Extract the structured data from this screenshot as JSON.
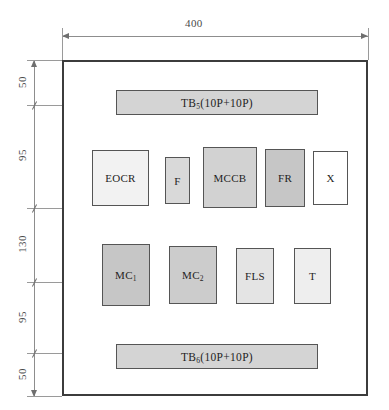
{
  "drawing": {
    "title": "Control panel internal component layout",
    "overall_width_label": "400",
    "vertical_dimensions": [
      "50",
      "95",
      "130",
      "95",
      "50"
    ],
    "enclosure": {
      "fill": "#ffffff",
      "border_color": "#3c3c3c"
    }
  },
  "terminals": [
    {
      "name": "TB5",
      "label": "TB",
      "subscript": "5",
      "suffix": "(10P+10P)",
      "fill": "#d4d4d4"
    },
    {
      "name": "TB6",
      "label": "TB",
      "subscript": "6",
      "suffix": "(10P+10P)",
      "fill": "#d4d4d4"
    }
  ],
  "components_row_upper": [
    {
      "label": "EOCR",
      "subscript": "",
      "fill": "#f2f2f2"
    },
    {
      "label": "F",
      "subscript": "",
      "fill": "#d9d9d9"
    },
    {
      "label": "MCCB",
      "subscript": "",
      "fill": "#d2d2d2"
    },
    {
      "label": "FR",
      "subscript": "",
      "fill": "#c6c6c6"
    },
    {
      "label": "X",
      "subscript": "",
      "fill": "#ffffff"
    }
  ],
  "components_row_lower": [
    {
      "label": "MC",
      "subscript": "1",
      "fill": "#c6c6c6"
    },
    {
      "label": "MC",
      "subscript": "2",
      "fill": "#cccccc"
    },
    {
      "label": "FLS",
      "subscript": "",
      "fill": "#e4e4e4"
    },
    {
      "label": "T",
      "subscript": "",
      "fill": "#eeeeee"
    }
  ]
}
